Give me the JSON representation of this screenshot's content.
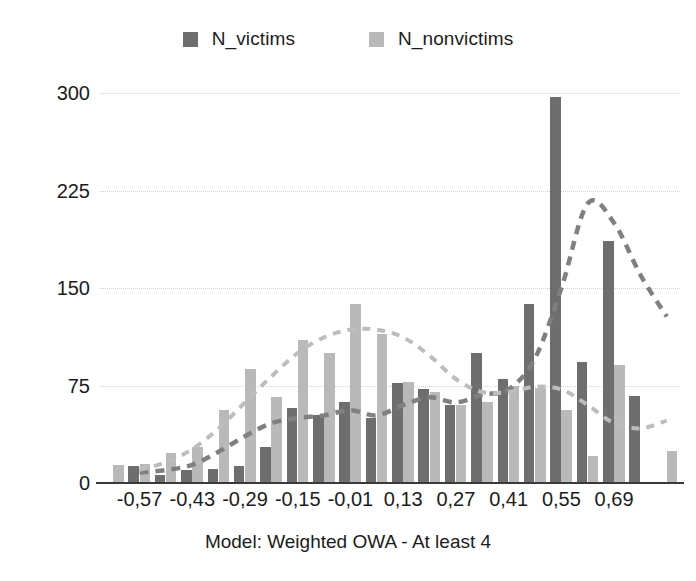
{
  "chart_data": {
    "type": "bar",
    "title": "",
    "caption": "Model: Weighted OWA - At least 4",
    "xlabel": "Model: Weighted OWA - At least 4",
    "ylabel": "",
    "ylim": [
      0,
      300
    ],
    "yticks": [
      0,
      75,
      150,
      225,
      300
    ],
    "ytick_labels": [
      "0",
      "75",
      "150",
      "225",
      "300"
    ],
    "grid": true,
    "legend_position": "top-center",
    "xtick_labels": [
      "-0,57",
      "-0,43",
      "-0,29",
      "-0,15",
      "-0,01",
      "0,13",
      "0,27",
      "0,41",
      "0,55",
      "0,69"
    ],
    "xtick_indices": [
      1,
      3,
      5,
      7,
      9,
      11,
      13,
      15,
      17,
      19
    ],
    "categories": [
      "-0,64",
      "-0,57",
      "-0,50",
      "-0,43",
      "-0,36",
      "-0,29",
      "-0,22",
      "-0,15",
      "-0,08",
      "-0,01",
      "0,06",
      "0,13",
      "0,20",
      "0,27",
      "0,34",
      "0,41",
      "0,48",
      "0,55",
      "0,62",
      "0,69",
      "0,76",
      "0,83"
    ],
    "series": [
      {
        "name": "N_victims",
        "color": "#6e6e6e",
        "values": [
          0,
          13,
          6,
          10,
          11,
          13,
          28,
          58,
          52,
          62,
          50,
          77,
          72,
          60,
          100,
          80,
          138,
          297,
          93,
          186,
          67,
          0
        ]
      },
      {
        "name": "N_nonvictims",
        "color": "#b9b9b9",
        "values": [
          14,
          15,
          23,
          28,
          56,
          88,
          66,
          110,
          100,
          138,
          115,
          78,
          70,
          60,
          62,
          75,
          73,
          56,
          21,
          91,
          0,
          25
        ]
      }
    ],
    "trendlines": [
      {
        "name": "N_victims_trend",
        "color": "#808080",
        "style": "dashed",
        "values": [
          null,
          8,
          10,
          14,
          24,
          36,
          46,
          50,
          52,
          56,
          52,
          60,
          66,
          62,
          68,
          72,
          96,
          150,
          215,
          200,
          160,
          128
        ]
      },
      {
        "name": "N_nonvictims_trend",
        "color": "#bdbdbd",
        "style": "dashed",
        "values": [
          null,
          10,
          16,
          26,
          42,
          62,
          82,
          100,
          112,
          118,
          118,
          112,
          98,
          80,
          70,
          70,
          74,
          72,
          60,
          46,
          42,
          48
        ]
      }
    ]
  },
  "legend": {
    "items": [
      {
        "label": "N_victims",
        "color": "#6e6e6e"
      },
      {
        "label": "N_nonvictims",
        "color": "#b9b9b9"
      }
    ]
  },
  "caption": {
    "text": "Model: Weighted OWA - At least 4"
  }
}
